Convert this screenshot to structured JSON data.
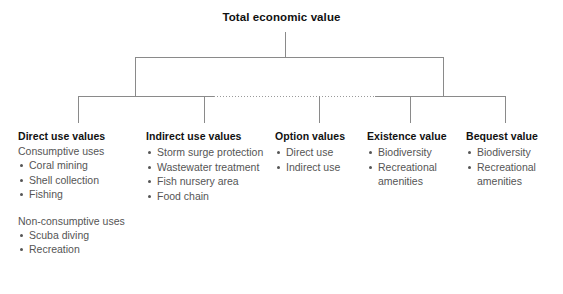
{
  "diagram": {
    "root": {
      "label": "Total economic value"
    },
    "columns": [
      {
        "heading": "Direct use values",
        "groups": [
          {
            "label": "Consumptive uses",
            "items": [
              "Coral mining",
              "Shell collection",
              "Fishing"
            ]
          },
          {
            "label": "Non-consumptive uses",
            "items": [
              "Scuba diving",
              "Recreation"
            ]
          }
        ]
      },
      {
        "heading": "Indirect use values",
        "groups": [
          {
            "label": "",
            "items": [
              "Storm surge protection",
              "Wastewater treatment",
              "Fish nursery area",
              "Food chain"
            ]
          }
        ]
      },
      {
        "heading": "Option values",
        "groups": [
          {
            "label": "",
            "items": [
              "Direct use",
              "Indirect use"
            ]
          }
        ]
      },
      {
        "heading": "Existence value",
        "groups": [
          {
            "label": "",
            "items": [
              "Biodiversity",
              "Recreational"
            ],
            "continuations": [
              "amenities"
            ]
          }
        ]
      },
      {
        "heading": "Bequest value",
        "groups": [
          {
            "label": "",
            "items": [
              "Biodiversity",
              "Recreational"
            ],
            "continuations": [
              "amenities"
            ]
          }
        ]
      }
    ]
  },
  "style": {
    "line_color": "#8a8a8a",
    "heading_color": "#111111",
    "body_color": "#555555",
    "background": "#ffffff"
  }
}
